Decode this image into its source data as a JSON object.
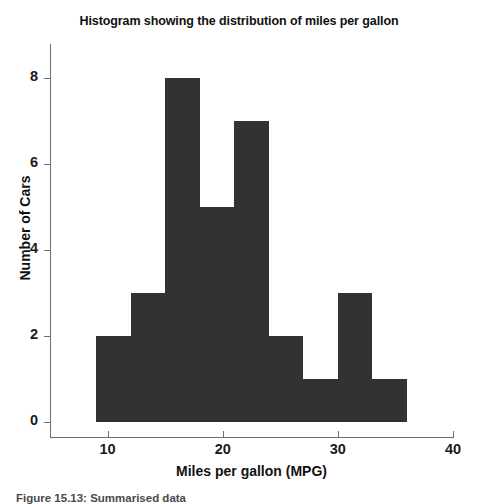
{
  "chart_data": {
    "type": "bar",
    "title": "Histogram showing the distribution of miles per gallon",
    "xlabel": "Miles per gallon (MPG)",
    "ylabel": "Number of Cars",
    "xlim": [
      5,
      40
    ],
    "ylim": [
      0,
      8.6
    ],
    "grid": false,
    "legend": null,
    "bar_color": "#333233",
    "axis_color": "#6e6e6e",
    "bin_width": 3,
    "bin_edges": [
      9,
      12,
      15,
      18,
      21,
      24,
      27,
      30,
      33,
      36
    ],
    "categories": [
      "9-12",
      "12-15",
      "15-18",
      "18-21",
      "21-24",
      "24-27",
      "27-30",
      "30-33",
      "33-36"
    ],
    "values": [
      2,
      3,
      8,
      5,
      7,
      2,
      1,
      3,
      1
    ],
    "xticks": [
      10,
      20,
      30,
      40
    ],
    "xtick_labels": [
      "10",
      "20",
      "30",
      "40"
    ],
    "yticks": [
      0,
      2,
      4,
      6,
      8
    ],
    "ytick_labels": [
      "0",
      "2",
      "4",
      "6",
      "8"
    ]
  },
  "caption": {
    "text": "Figure 15.13: Summarised data"
  }
}
